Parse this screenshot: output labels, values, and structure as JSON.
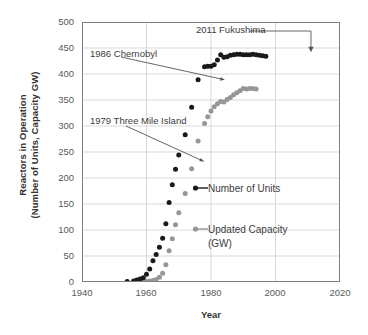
{
  "chart_data": {
    "type": "scatter",
    "title": "",
    "xlabel": "Year",
    "ylabel_line1": "Reactors in Operation",
    "ylabel_line2": "(Number of Units, Capacity GW)",
    "xlim": [
      1940,
      2020
    ],
    "ylim": [
      0,
      500
    ],
    "xticks": [
      1940,
      1960,
      1980,
      2000,
      2020
    ],
    "yticks": [
      0,
      50,
      100,
      150,
      200,
      250,
      300,
      350,
      400,
      450,
      500
    ],
    "grid": true,
    "legend_position": "inside-right",
    "series": [
      {
        "name": "Number of Units",
        "color": "#1a1a1a",
        "marker": "circle",
        "points": [
          [
            1954,
            1
          ],
          [
            1956,
            2
          ],
          [
            1957,
            4
          ],
          [
            1958,
            6
          ],
          [
            1959,
            8
          ],
          [
            1960,
            15
          ],
          [
            1961,
            25
          ],
          [
            1962,
            41
          ],
          [
            1963,
            53
          ],
          [
            1964,
            67
          ],
          [
            1965,
            84
          ],
          [
            1966,
            112
          ],
          [
            1967,
            153
          ],
          [
            1968,
            187
          ],
          [
            1969,
            217
          ],
          [
            1970,
            244
          ],
          [
            1972,
            283
          ],
          [
            1974,
            336
          ],
          [
            1976,
            389
          ],
          [
            1978,
            414
          ],
          [
            1979,
            415
          ],
          [
            1980,
            415
          ],
          [
            1981,
            418
          ],
          [
            1982,
            427
          ],
          [
            1983,
            437
          ],
          [
            1984,
            432
          ],
          [
            1985,
            433
          ],
          [
            1986,
            436
          ],
          [
            1987,
            437
          ],
          [
            1988,
            438
          ],
          [
            1989,
            438
          ],
          [
            1990,
            437
          ],
          [
            1991,
            437
          ],
          [
            1992,
            437
          ],
          [
            1993,
            438
          ],
          [
            1994,
            437
          ],
          [
            1995,
            436
          ],
          [
            1996,
            435
          ],
          [
            1997,
            434
          ]
        ]
      },
      {
        "name": "Updated Capacity (GW)",
        "color": "#969696",
        "marker": "circle",
        "points": [
          [
            1954,
            0
          ],
          [
            1956,
            0
          ],
          [
            1957,
            1
          ],
          [
            1958,
            1
          ],
          [
            1959,
            1
          ],
          [
            1960,
            1
          ],
          [
            1961,
            2
          ],
          [
            1962,
            3
          ],
          [
            1963,
            5
          ],
          [
            1964,
            9
          ],
          [
            1965,
            17
          ],
          [
            1966,
            33
          ],
          [
            1967,
            60
          ],
          [
            1968,
            83
          ],
          [
            1969,
            110
          ],
          [
            1970,
            133
          ],
          [
            1972,
            170
          ],
          [
            1974,
            218
          ],
          [
            1976,
            271
          ],
          [
            1978,
            305
          ],
          [
            1979,
            318
          ],
          [
            1980,
            329
          ],
          [
            1981,
            337
          ],
          [
            1982,
            343
          ],
          [
            1983,
            347
          ],
          [
            1984,
            346
          ],
          [
            1985,
            351
          ],
          [
            1986,
            355
          ],
          [
            1987,
            360
          ],
          [
            1988,
            364
          ],
          [
            1989,
            368
          ],
          [
            1990,
            372
          ],
          [
            1991,
            371
          ],
          [
            1992,
            372
          ],
          [
            1993,
            372
          ],
          [
            1994,
            371
          ]
        ]
      }
    ],
    "annotations": [
      {
        "label": "2011 Fukushima",
        "target_x": 2011,
        "target_y": 440
      },
      {
        "label": "1986 Chernobyl",
        "target_x": 1986,
        "target_y": 389
      },
      {
        "label": "1979 Three Mile Island",
        "target_x": 1979,
        "target_y": 232
      }
    ]
  },
  "legend": {
    "units_label": "Number of Units",
    "capacity_label_line1": "Updated Capacity",
    "capacity_label_line2": "(GW)"
  },
  "annotations": {
    "fukushima": "2011 Fukushima",
    "chernobyl": "1986 Chernobyl",
    "three_mile_island": "1979 Three Mile Island"
  },
  "axes": {
    "xlabel": "Year",
    "ylabel_line1": "Reactors in Operation",
    "ylabel_line2": "(Number of Units, Capacity GW)",
    "yticks": [
      "500",
      "450",
      "400",
      "350",
      "300",
      "250",
      "200",
      "150",
      "100",
      "50",
      "0"
    ],
    "xticks": [
      "1940",
      "1960",
      "1980",
      "2000",
      "2020"
    ]
  },
  "colors": {
    "units": "#1a1a1a",
    "capacity": "#969696",
    "grid": "#d9d9d9",
    "axis": "#7f7f7f",
    "text": "#404040"
  }
}
